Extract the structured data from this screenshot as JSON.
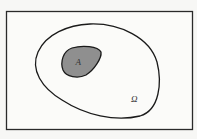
{
  "diagram": {
    "type": "venn",
    "universe_label": "Ω",
    "set_label": "A",
    "colors": {
      "background": "#f7f7f5",
      "frame": "#2a2a2a",
      "outline": "#1a1a1a",
      "set_fill": "#8f8f8f"
    }
  }
}
